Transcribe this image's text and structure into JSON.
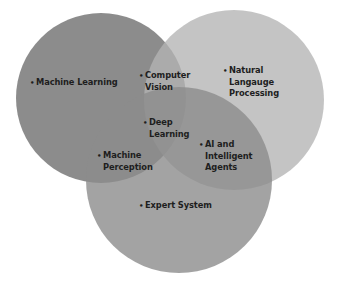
{
  "diagram": {
    "type": "venn",
    "background": "#ffffff",
    "circles": [
      {
        "id": "left",
        "cx": 101,
        "cy": 98,
        "r": 85,
        "color": "#808080",
        "opacity": 0.9
      },
      {
        "id": "right",
        "cx": 234,
        "cy": 100,
        "r": 90,
        "color": "#b4b4b4",
        "opacity": 0.75
      },
      {
        "id": "bottom",
        "cx": 179,
        "cy": 180,
        "r": 93,
        "color": "#8c8c8c",
        "opacity": 0.8
      }
    ],
    "bullet": "•",
    "labels": {
      "machine_learning": {
        "lines": [
          "Machine Learning"
        ]
      },
      "computer_vision": {
        "lines": [
          "Computer",
          "Vision"
        ]
      },
      "nlp": {
        "lines": [
          "Natural",
          "Langauge",
          "Processing"
        ]
      },
      "deep_learning": {
        "lines": [
          "Deep",
          "Learning"
        ]
      },
      "machine_perception": {
        "lines": [
          "Machine",
          "Perception"
        ]
      },
      "ai_agents": {
        "lines": [
          "AI and",
          "Intelligent",
          "Agents"
        ]
      },
      "expert_system": {
        "lines": [
          "Expert System"
        ]
      }
    }
  }
}
